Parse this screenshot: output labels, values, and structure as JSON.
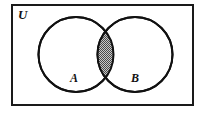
{
  "figure": {
    "kind": "venn-diagram",
    "width": 207,
    "height": 114,
    "background_color": "#ffffff"
  },
  "universe": {
    "label": "U",
    "label_x": 18,
    "label_y": 19,
    "rect": {
      "x": 11,
      "y": 4,
      "width": 183,
      "height": 102
    },
    "border_color": "#1a1a1a",
    "border_width": 2,
    "fill_color": "#ffffff"
  },
  "sets": [
    {
      "id": "set-a",
      "label": "A",
      "cx": 76,
      "cy": 54.5,
      "r": 37.5,
      "label_x": 70,
      "label_y": 82,
      "stroke_color": "#111111",
      "stroke_width": 2,
      "fill_color": "#ffffff"
    },
    {
      "id": "set-b",
      "label": "B",
      "cx": 135,
      "cy": 54.5,
      "r": 37.5,
      "label_x": 131,
      "label_y": 82,
      "stroke_color": "#111111",
      "stroke_width": 2,
      "fill_color": "#ffffff"
    }
  ],
  "intersection": {
    "id": "intersection-region",
    "label": "A intersect B",
    "shaded": true,
    "fill_pattern": "checkerboard-stipple",
    "pattern_color": "#4a4a4a",
    "pattern_background": "#c9c9c9",
    "stroke_color": "#111111",
    "stroke_width": 2,
    "top_crossing": {
      "x": 107,
      "y": 29
    },
    "bottom_crossing": {
      "x": 107,
      "y": 80
    },
    "left_extent_x": 96,
    "right_extent_x": 117
  },
  "legend_note": {
    "shaded_meaning": "Shaded lens denotes the intersection of A and B"
  }
}
